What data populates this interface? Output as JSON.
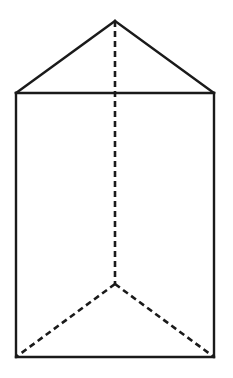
{
  "diagram": {
    "type": "3d-solid",
    "stroke_color": "#1a1a1a",
    "background": "#ffffff",
    "vertices": {
      "apex_top_back": [
        115,
        21
      ],
      "top_front_left": [
        16,
        93
      ],
      "top_front_right": [
        214,
        93
      ],
      "bottom_front_left": [
        16,
        357
      ],
      "bottom_front_right": [
        214,
        357
      ],
      "bottom_back": [
        115,
        284
      ]
    },
    "solid_edges": [
      [
        "apex_top_back",
        "top_front_left"
      ],
      [
        "apex_top_back",
        "top_front_right"
      ],
      [
        "top_front_left",
        "top_front_right"
      ],
      [
        "top_front_left",
        "bottom_front_left"
      ],
      [
        "top_front_right",
        "bottom_front_right"
      ],
      [
        "bottom_front_left",
        "bottom_front_right"
      ]
    ],
    "hidden_edges": [
      [
        "apex_top_back",
        "bottom_back"
      ],
      [
        "bottom_back",
        "bottom_front_left"
      ],
      [
        "bottom_back",
        "bottom_front_right"
      ]
    ],
    "hidden_edge_style": "dashed"
  }
}
